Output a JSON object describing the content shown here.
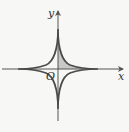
{
  "diagram": {
    "type": "astroid",
    "equation": "x^(2/3) + y^(2/3) = a^(2/3)",
    "labels": {
      "x_axis": "x",
      "y_axis": "y",
      "origin": "O"
    },
    "shaded_region": "first quadrant area bounded by the curve and the axes",
    "colors": {
      "curve": "#4a4a4a",
      "axes": "#555555",
      "shade": "#c8c8c8",
      "background": "#f7f7f5"
    }
  }
}
